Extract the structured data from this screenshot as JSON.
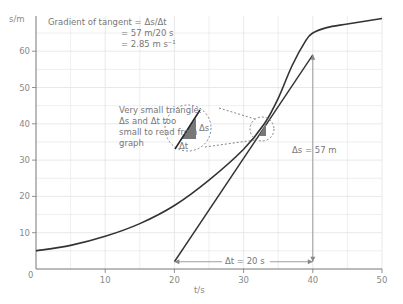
{
  "chart_data": {
    "type": "line",
    "title": "",
    "xlabel": "t/s",
    "ylabel": "s/m",
    "xlim": [
      0,
      50
    ],
    "ylim": [
      0,
      67
    ],
    "x_ticks": [
      0,
      10,
      20,
      30,
      40,
      50
    ],
    "y_ticks": [
      10,
      20,
      30,
      40,
      50,
      60
    ],
    "grid": true,
    "series": [
      {
        "name": "displacement curve",
        "x": [
          0,
          5,
          10,
          15,
          20,
          25,
          30,
          33,
          35,
          37,
          39,
          40,
          42,
          45,
          50
        ],
        "y": [
          5,
          6.5,
          9,
          12.5,
          17.5,
          24.5,
          33,
          40,
          47,
          56,
          63,
          65,
          66.5,
          67.5,
          69
        ]
      },
      {
        "name": "tangent",
        "x": [
          20,
          40
        ],
        "y": [
          2,
          59
        ]
      }
    ],
    "annotations": {
      "gradient_lines": [
        "Gradient of tangent = Δs/Δt",
        "= 57 m/20 s",
        "= 2.85 m s⁻¹"
      ],
      "triangle_note": [
        "Very small triangle:",
        "Δs and Δt too",
        "small to read from",
        "graph"
      ],
      "delta_s_small": "Δs",
      "delta_t_small": "Δt",
      "delta_s_big": "Δs = 57 m",
      "delta_t_big": "Δt = 20 s"
    }
  },
  "axes": {
    "y_label": "s/m",
    "x_label": "t/s",
    "origin": "0",
    "x_tick_labels": [
      "10",
      "20",
      "30",
      "40",
      "50"
    ],
    "y_tick_labels": [
      "10",
      "20",
      "30",
      "40",
      "50",
      "60"
    ]
  }
}
